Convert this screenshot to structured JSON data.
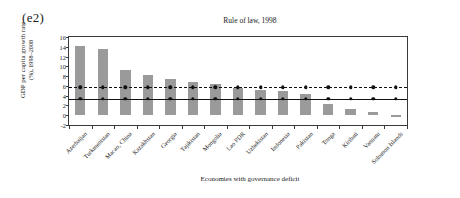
{
  "panel": {
    "label": "(e2)"
  },
  "axis_caption": {
    "x": "Economies with governance deficit"
  },
  "ylabel": {
    "line1": "GDP per capita growth rate",
    "line2": "(%), 1998–2008"
  },
  "chart_data": {
    "type": "bar",
    "title": "Rule of law, 1998",
    "xlabel": "Economies with governance deficit",
    "ylabel": "GDP per capita growth rate (%), 1998–2008",
    "ylim": [
      -2,
      16
    ],
    "yticks": [
      -2,
      0,
      2,
      4,
      6,
      8,
      10,
      12,
      14,
      16
    ],
    "ytick_labels": [
      "-2",
      "0",
      "2",
      "4",
      "6",
      "8",
      "10",
      "12",
      "14",
      "16"
    ],
    "grid": false,
    "legend": "none",
    "categories": [
      "Azerbaijan",
      "Turkmenistan",
      "Macao, China",
      "Kazakhstan",
      "Georgia",
      "Tajikistan",
      "Mongolia",
      "Lao PDR",
      "Uzbekistan",
      "Indonesia",
      "Pakistan",
      "Tonga",
      "Kiribati",
      "Vanuatu",
      "Solomon Islands"
    ],
    "series": [
      {
        "name": "GDP per capita growth rate",
        "type": "bar",
        "values": [
          14.1,
          13.5,
          9.3,
          8.2,
          7.5,
          6.8,
          6.3,
          5.5,
          5.2,
          4.9,
          4.3,
          2.2,
          1.3,
          0.6,
          -0.4
        ]
      },
      {
        "name": "Reference line (dashed)",
        "type": "line-with-markers",
        "style": "dashed",
        "value": 5.7,
        "values": [
          5.7,
          5.7,
          5.7,
          5.7,
          5.7,
          5.7,
          5.7,
          5.7,
          5.7,
          5.7,
          5.7,
          5.7,
          5.7,
          5.7,
          5.7
        ]
      },
      {
        "name": "Reference line (solid)",
        "type": "line-with-markers",
        "style": "solid",
        "value": 3.3,
        "values": [
          3.3,
          3.3,
          3.3,
          3.3,
          3.3,
          3.3,
          3.3,
          3.3,
          3.3,
          3.3,
          3.3,
          3.3,
          3.3,
          3.3,
          3.3
        ]
      }
    ],
    "colors": {
      "bar": "#9a9a9a",
      "line": "#111111",
      "axis": "#3a3a3a",
      "background": "#ffffff"
    }
  }
}
